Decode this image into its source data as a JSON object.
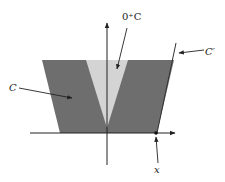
{
  "diagram": {
    "labels": {
      "recession_cone": "0⁺C",
      "set_C": "C",
      "set_C_prime": "C′",
      "point_x": "x"
    },
    "colors": {
      "set_C_fill": "#6e6e6e",
      "recession_cone_fill": "#d4d4d4",
      "axis": "#222222",
      "background": "#ffffff"
    },
    "geometry": {
      "origin": [
        107,
        133
      ],
      "trapezoid_C": [
        [
          42,
          60
        ],
        [
          174,
          60
        ],
        [
          157,
          133
        ],
        [
          60,
          133
        ]
      ],
      "cone_0plusC": [
        [
          86,
          60
        ],
        [
          128,
          60
        ],
        [
          107,
          128
        ]
      ],
      "line_C_prime": [
        [
          157,
          133
        ],
        [
          176,
          43
        ]
      ],
      "point_x": [
        156,
        133
      ]
    }
  }
}
